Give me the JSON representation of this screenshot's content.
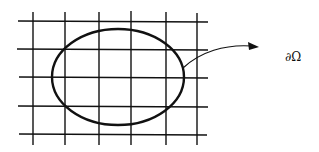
{
  "diagram": {
    "type": "domain-on-grid",
    "grid": {
      "vertical_lines_x": [
        33,
        65,
        99,
        131,
        166,
        197
      ],
      "horizontal_lines_y": [
        21,
        49,
        77,
        106,
        134
      ],
      "x_extent": [
        18,
        208
      ],
      "y_extent": [
        12,
        145
      ],
      "stroke": "#111111"
    },
    "domain": {
      "shape": "ellipse",
      "cx": 118,
      "cy": 77,
      "rx": 66,
      "ry": 48,
      "stroke": "#111111"
    },
    "arrow": {
      "from": [
        183,
        68
      ],
      "to": [
        258,
        47
      ],
      "color": "#111111"
    },
    "boundary_label": "∂Ω"
  }
}
